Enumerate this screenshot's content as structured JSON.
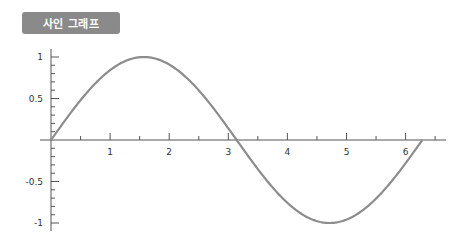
{
  "title": "사인 그래프",
  "colors": {
    "badge": "#8a8a8a",
    "curve": "#8c8c8c",
    "axis": "#555555"
  },
  "chart_data": {
    "type": "line",
    "title": "사인 그래프",
    "function": "y = sin(x)",
    "xlabel": "",
    "ylabel": "",
    "xlim": [
      0,
      6.6
    ],
    "ylim": [
      -1.1,
      1.1
    ],
    "x_ticks": [
      1,
      2,
      3,
      4,
      5,
      6
    ],
    "x_tick_labels": [
      "1",
      "2",
      "3",
      "4",
      "5",
      "6"
    ],
    "y_ticks": [
      1,
      0.5,
      -0.5,
      -1
    ],
    "y_tick_labels": [
      "1",
      "0.5",
      "-0.5",
      "-1"
    ],
    "grid": false,
    "legend": null,
    "series": [
      {
        "name": "sin(x)",
        "x": [
          0,
          0.5,
          1,
          1.5708,
          2,
          2.5,
          3,
          3.1416,
          3.5,
          4,
          4.5,
          4.7124,
          5,
          5.5,
          6,
          6.2832
        ],
        "values": [
          0,
          0.479,
          0.841,
          1,
          0.909,
          0.598,
          0.141,
          0,
          -0.351,
          -0.757,
          -0.978,
          -1,
          -0.959,
          -0.706,
          -0.279,
          0
        ]
      }
    ]
  }
}
